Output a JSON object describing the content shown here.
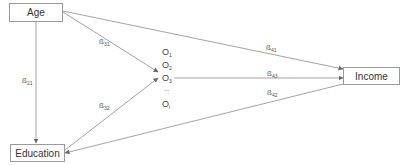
{
  "nodes": {
    "age": {
      "label": "Age"
    },
    "education": {
      "label": "Education"
    },
    "income": {
      "label": "Income"
    },
    "mediators": [
      {
        "base": "O",
        "sub": "1"
      },
      {
        "base": "O",
        "sub": "2"
      },
      {
        "base": "O",
        "sub": "3"
      },
      {
        "base": "O",
        "sub": "i"
      }
    ],
    "ellipsis": "..."
  },
  "paths": [
    {
      "from": "Age",
      "to": "Education",
      "base": "ß",
      "sub": "21"
    },
    {
      "from": "Age",
      "to": "O3",
      "base": "ß",
      "sub": "31"
    },
    {
      "from": "Education",
      "to": "O3",
      "base": "ß",
      "sub": "32"
    },
    {
      "from": "Age",
      "to": "Income",
      "base": "ß",
      "sub": "41"
    },
    {
      "from": "O3",
      "to": "Income",
      "base": "ß",
      "sub": "43"
    },
    {
      "from": "Education",
      "to": "Income",
      "base": "ß",
      "sub": "42"
    }
  ],
  "colors": {
    "line": "#8c8c8c",
    "box_border": "#9a9a9a",
    "text": "#333333"
  }
}
